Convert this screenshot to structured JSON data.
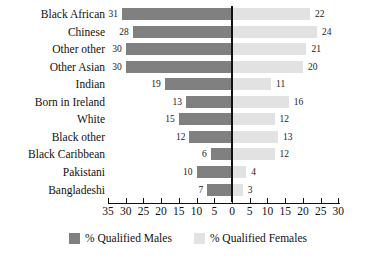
{
  "chart_data": {
    "type": "bar",
    "orientation": "horizontal",
    "style": "diverging-bidirectional-bar",
    "title": "",
    "subtitle": "",
    "xlabel": "",
    "ylabel": "",
    "grid": false,
    "legend_position": "bottom-center",
    "axis": {
      "tick_labels": [
        "35",
        "30",
        "25",
        "20",
        "15",
        "10",
        "5",
        "0",
        "5",
        "10",
        "15",
        "20",
        "25",
        "30"
      ],
      "tick_values": [
        -35,
        -30,
        -25,
        -20,
        -15,
        -10,
        -5,
        0,
        5,
        10,
        15,
        20,
        25,
        30
      ],
      "left_max": 35,
      "right_max": 30
    },
    "categories": [
      "Black African",
      "Chinese",
      "Other other",
      "Other Asian",
      "Indian",
      "Born in Ireland",
      "White",
      "Black other",
      "Black Caribbean",
      "Pakistani",
      "Bangladeshi"
    ],
    "series": [
      {
        "name": "% Qualified Males",
        "side": "left",
        "color": "#808080",
        "values": [
          31,
          28,
          30,
          30,
          19,
          13,
          15,
          12,
          6,
          10,
          7
        ]
      },
      {
        "name": "% Qualified Females",
        "side": "right",
        "color": "#e2e2e2",
        "values": [
          22,
          24,
          21,
          20,
          11,
          16,
          12,
          13,
          12,
          4,
          3
        ]
      }
    ]
  },
  "legend": {
    "items": [
      {
        "label": "% Qualified Males",
        "swatch": "male"
      },
      {
        "label": "% Qualified Females",
        "swatch": "female"
      }
    ]
  },
  "colors": {
    "male_bar": "#808080",
    "female_bar": "#e2e2e2",
    "axis": "#111111",
    "background": "#ffffff"
  }
}
